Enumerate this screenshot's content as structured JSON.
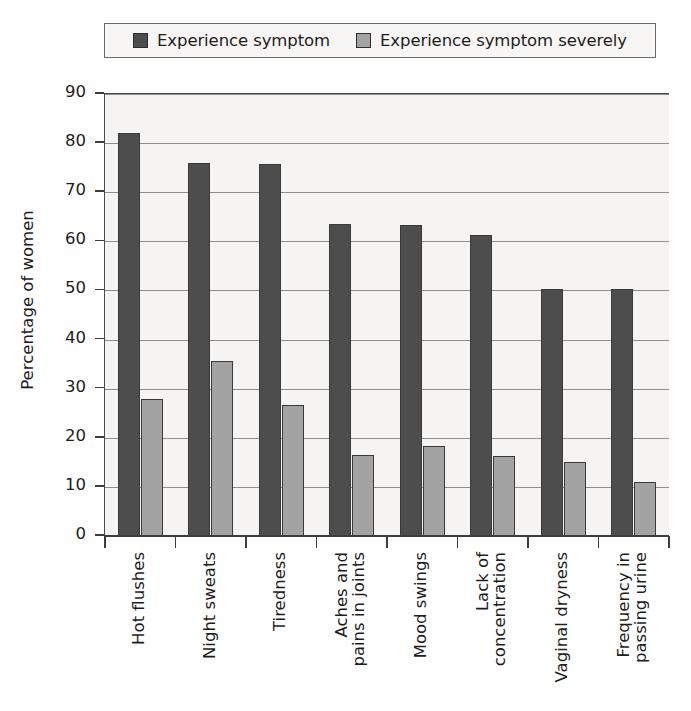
{
  "chart_data": {
    "type": "bar",
    "title": "",
    "xlabel": "",
    "ylabel": "Percentage of women",
    "ylim": [
      0,
      90
    ],
    "ytick_step": 10,
    "yticks": [
      "90",
      "80",
      "70",
      "60",
      "50",
      "40",
      "30",
      "20",
      "10",
      "0"
    ],
    "grid": true,
    "legend_position": "top",
    "categories": [
      "Hot flushes",
      "Night sweats",
      "Tiredness",
      "Aches and pains in joints",
      "Mood swings",
      "Lack of concentration",
      "Vaginal dryness",
      "Frequency in passing urine"
    ],
    "category_lines": [
      [
        "Hot flushes"
      ],
      [
        "Night sweats"
      ],
      [
        "Tiredness"
      ],
      [
        "Aches and",
        "pains in joints"
      ],
      [
        "Mood swings"
      ],
      [
        "Lack of",
        "concentration"
      ],
      [
        "Vaginal dryness"
      ],
      [
        "Frequency in",
        "passing urine"
      ]
    ],
    "series": [
      {
        "name": "Experience symptom",
        "color": "#4d4d4d",
        "values": [
          82,
          76,
          75.8,
          63.5,
          63.4,
          61.2,
          50.2,
          50.2
        ]
      },
      {
        "name": "Experience symptom severely",
        "color": "#a3a3a3",
        "values": [
          28,
          35.7,
          26.7,
          16.5,
          18.4,
          16.2,
          15,
          11
        ]
      }
    ]
  },
  "legend": {
    "entries": [
      {
        "label": "Experience symptom",
        "color": "#4d4d4d"
      },
      {
        "label": "Experience symptom severely",
        "color": "#a3a3a3"
      }
    ]
  }
}
